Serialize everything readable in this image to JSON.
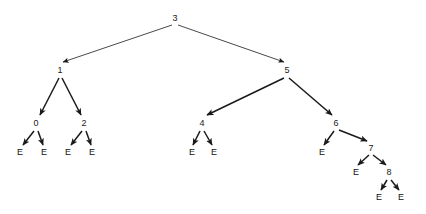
{
  "figure": {
    "type": "binary-search-tree-diagram",
    "background_color": "#ffffff",
    "edge_color": "#1a1a1a",
    "text_color": "#1a1a1a",
    "width": 426,
    "height": 214
  },
  "nodes": [
    {
      "id": "n3",
      "label": "3",
      "x": 175,
      "y": 18,
      "kind": "internal",
      "depth": 0
    },
    {
      "id": "n1",
      "label": "1",
      "x": 60,
      "y": 70,
      "kind": "internal",
      "depth": 1
    },
    {
      "id": "n5",
      "label": "5",
      "x": 287,
      "y": 70,
      "kind": "internal",
      "depth": 1
    },
    {
      "id": "n0",
      "label": "0",
      "x": 36,
      "y": 123,
      "kind": "internal",
      "depth": 2
    },
    {
      "id": "n2",
      "label": "2",
      "x": 84,
      "y": 123,
      "kind": "internal",
      "depth": 2
    },
    {
      "id": "n4",
      "label": "4",
      "x": 202,
      "y": 123,
      "kind": "internal",
      "depth": 2
    },
    {
      "id": "n6",
      "label": "6",
      "x": 336,
      "y": 123,
      "kind": "internal",
      "depth": 2
    },
    {
      "id": "n7",
      "label": "7",
      "x": 371,
      "y": 148,
      "kind": "internal",
      "depth": 3
    },
    {
      "id": "n8",
      "label": "8",
      "x": 389,
      "y": 172,
      "kind": "internal",
      "depth": 4
    },
    {
      "id": "e0l",
      "label": "E",
      "x": 20,
      "y": 152,
      "kind": "leaf",
      "depth": 3
    },
    {
      "id": "e0r",
      "label": "E",
      "x": 44,
      "y": 152,
      "kind": "leaf",
      "depth": 3
    },
    {
      "id": "e2l",
      "label": "E",
      "x": 68,
      "y": 152,
      "kind": "leaf",
      "depth": 3
    },
    {
      "id": "e2r",
      "label": "E",
      "x": 92,
      "y": 152,
      "kind": "leaf",
      "depth": 3
    },
    {
      "id": "e4l",
      "label": "E",
      "x": 192,
      "y": 152,
      "kind": "leaf",
      "depth": 3
    },
    {
      "id": "e4r",
      "label": "E",
      "x": 214,
      "y": 152,
      "kind": "leaf",
      "depth": 3
    },
    {
      "id": "e6l",
      "label": "E",
      "x": 322,
      "y": 152,
      "kind": "leaf",
      "depth": 3
    },
    {
      "id": "e7l",
      "label": "E",
      "x": 356,
      "y": 172,
      "kind": "leaf",
      "depth": 4
    },
    {
      "id": "e8l",
      "label": "E",
      "x": 379,
      "y": 197,
      "kind": "leaf",
      "depth": 5
    },
    {
      "id": "e8r",
      "label": "E",
      "x": 401,
      "y": 197,
      "kind": "leaf",
      "depth": 5
    }
  ],
  "edges": [
    {
      "from": "n3",
      "to": "n1",
      "x1": 172,
      "y1": 25,
      "x2": 63,
      "y2": 62,
      "weight": "thin"
    },
    {
      "from": "n3",
      "to": "n5",
      "x1": 178,
      "y1": 25,
      "x2": 284,
      "y2": 62,
      "weight": "thin"
    },
    {
      "from": "n1",
      "to": "n0",
      "x1": 59,
      "y1": 78,
      "x2": 40,
      "y2": 115,
      "weight": "thick"
    },
    {
      "from": "n1",
      "to": "n2",
      "x1": 62,
      "y1": 78,
      "x2": 81,
      "y2": 115,
      "weight": "thick"
    },
    {
      "from": "n5",
      "to": "n4",
      "x1": 284,
      "y1": 78,
      "x2": 207,
      "y2": 115,
      "weight": "thick"
    },
    {
      "from": "n5",
      "to": "n6",
      "x1": 289,
      "y1": 78,
      "x2": 332,
      "y2": 115,
      "weight": "thick"
    },
    {
      "from": "n0",
      "to": "e0l",
      "x1": 34,
      "y1": 131,
      "x2": 23,
      "y2": 145,
      "weight": "thick"
    },
    {
      "from": "n0",
      "to": "e0r",
      "x1": 38,
      "y1": 131,
      "x2": 43,
      "y2": 145,
      "weight": "thick"
    },
    {
      "from": "n2",
      "to": "e2l",
      "x1": 82,
      "y1": 131,
      "x2": 71,
      "y2": 145,
      "weight": "thick"
    },
    {
      "from": "n2",
      "to": "e2r",
      "x1": 86,
      "y1": 131,
      "x2": 91,
      "y2": 145,
      "weight": "thick"
    },
    {
      "from": "n4",
      "to": "e4l",
      "x1": 200,
      "y1": 131,
      "x2": 193,
      "y2": 145,
      "weight": "thick"
    },
    {
      "from": "n4",
      "to": "e4r",
      "x1": 204,
      "y1": 131,
      "x2": 212,
      "y2": 145,
      "weight": "thick"
    },
    {
      "from": "n6",
      "to": "e6l",
      "x1": 334,
      "y1": 131,
      "x2": 324,
      "y2": 145,
      "weight": "thick"
    },
    {
      "from": "n6",
      "to": "n7",
      "x1": 339,
      "y1": 130,
      "x2": 367,
      "y2": 141,
      "weight": "thick"
    },
    {
      "from": "n7",
      "to": "e7l",
      "x1": 369,
      "y1": 155,
      "x2": 358,
      "y2": 165,
      "weight": "thick"
    },
    {
      "from": "n7",
      "to": "n8",
      "x1": 373,
      "y1": 155,
      "x2": 386,
      "y2": 165,
      "weight": "thick"
    },
    {
      "from": "n8",
      "to": "e8l",
      "x1": 387,
      "y1": 180,
      "x2": 381,
      "y2": 190,
      "weight": "thick"
    },
    {
      "from": "n8",
      "to": "e8r",
      "x1": 391,
      "y1": 180,
      "x2": 399,
      "y2": 190,
      "weight": "thick"
    }
  ],
  "tree_structure": {
    "root": "3",
    "children": {
      "3": [
        "1",
        "5"
      ],
      "1": [
        "0",
        "2"
      ],
      "5": [
        "4",
        "6"
      ],
      "0": [
        "E",
        "E"
      ],
      "2": [
        "E",
        "E"
      ],
      "4": [
        "E",
        "E"
      ],
      "6": [
        "E",
        "7"
      ],
      "7": [
        "E",
        "8"
      ],
      "8": [
        "E",
        "E"
      ]
    },
    "empty_marker": "E",
    "internal_values": [
      "0",
      "1",
      "2",
      "3",
      "4",
      "5",
      "6",
      "7",
      "8"
    ]
  }
}
